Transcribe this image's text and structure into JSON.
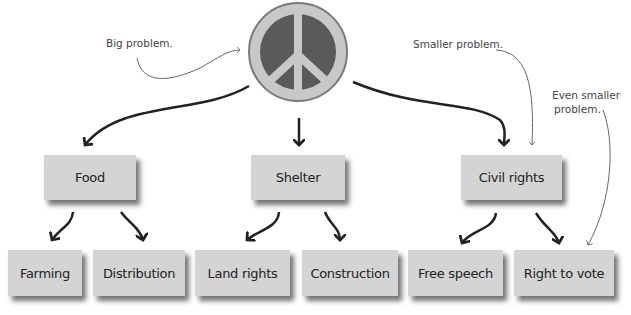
{
  "diagram": {
    "root": {
      "id": "peace",
      "icon": "peace-sign-icon",
      "colors": {
        "ring": "#c8c8c8",
        "fill": "#5a5a5a",
        "border": "#777777"
      }
    },
    "level1": [
      {
        "id": "food",
        "label": "Food"
      },
      {
        "id": "shelter",
        "label": "Shelter"
      },
      {
        "id": "civil",
        "label": "Civil rights"
      }
    ],
    "level2": [
      {
        "id": "farming",
        "label": "Farming",
        "parent": "food"
      },
      {
        "id": "distribution",
        "label": "Distribution",
        "parent": "food"
      },
      {
        "id": "land",
        "label": "Land rights",
        "parent": "shelter"
      },
      {
        "id": "construction",
        "label": "Construction",
        "parent": "shelter"
      },
      {
        "id": "speech",
        "label": "Free speech",
        "parent": "civil"
      },
      {
        "id": "vote",
        "label": "Right to vote",
        "parent": "civil"
      }
    ],
    "annotations": {
      "big": "Big problem.",
      "smaller": "Smaller problem.",
      "even_smaller_1": "Even smaller",
      "even_smaller_2": "problem."
    },
    "colors": {
      "box": "#d4d4d4",
      "arrow": "#222222",
      "annotation_arrow": "#666666"
    }
  }
}
